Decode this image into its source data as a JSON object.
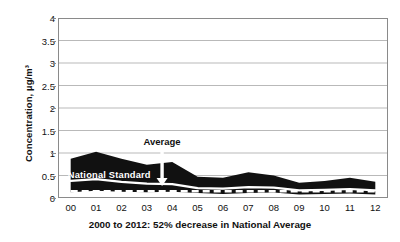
{
  "chart_data": {
    "type": "area",
    "title": "",
    "subtitle": "",
    "xlabel": "2000 to 2012: 52% decrease in National Average",
    "ylabel": "Concentration, µg/m³",
    "ylim": [
      0,
      4
    ],
    "ytick_values": [
      0,
      0.5,
      1,
      1.5,
      2,
      2.5,
      3,
      3.5,
      4
    ],
    "ytick_labels": [
      "0",
      "0.5",
      "1",
      "1.5",
      "2",
      "2.5",
      "3",
      "3.5",
      "4"
    ],
    "grid": "horizontal",
    "legend_position": "none",
    "categories": [
      "00",
      "01",
      "02",
      "03",
      "04",
      "05",
      "06",
      "07",
      "08",
      "09",
      "10",
      "11",
      "12"
    ],
    "x_years": [
      2000,
      2001,
      2002,
      2003,
      2004,
      2005,
      2006,
      2007,
      2008,
      2009,
      2010,
      2011,
      2012
    ],
    "series": [
      {
        "name": "90th Percentile",
        "style": "band-upper",
        "values": [
          0.87,
          1.03,
          0.87,
          0.74,
          0.8,
          0.47,
          0.45,
          0.57,
          0.5,
          0.34,
          0.38,
          0.45,
          0.36
        ]
      },
      {
        "name": "Average",
        "style": "white-solid-line",
        "values": [
          0.38,
          0.42,
          0.36,
          0.32,
          0.31,
          0.22,
          0.21,
          0.24,
          0.23,
          0.17,
          0.18,
          0.2,
          0.17
        ]
      },
      {
        "name": "10th Percentile",
        "style": "band-lower",
        "values": [
          0.13,
          0.16,
          0.14,
          0.13,
          0.14,
          0.11,
          0.09,
          0.11,
          0.12,
          0.08,
          0.09,
          0.1,
          0.08
        ]
      },
      {
        "name": "National Standard",
        "style": "white-dashed-line",
        "values": [
          0.15,
          0.15,
          0.15,
          0.15,
          0.15,
          0.15,
          0.15,
          0.15,
          0.15,
          0.15,
          0.15,
          0.15,
          0.15
        ]
      }
    ],
    "annotations": [
      {
        "id": "average",
        "text": "Average",
        "x_year": 2003.6,
        "y_value": 1.22,
        "points_to_y": 0.31
      },
      {
        "id": "national-standard",
        "text": "National Standard",
        "x_year": 2000.2,
        "y_value": 0.5
      }
    ],
    "colors": {
      "band": "#111111",
      "average_line": "#ffffff",
      "standard_line": "#ffffff",
      "grid": "#b9b9b9",
      "axis": "#8a8a8a",
      "text": "#111111",
      "background": "#ffffff"
    }
  }
}
